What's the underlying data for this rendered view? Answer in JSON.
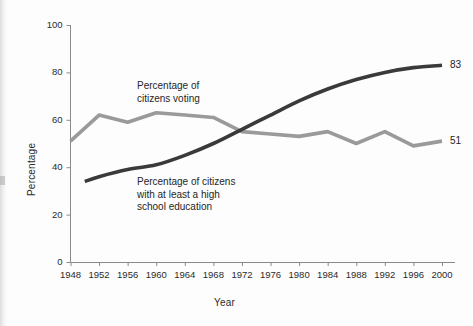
{
  "chart_data": {
    "type": "line",
    "title": "",
    "xlabel": "Year",
    "ylabel": "Percentage",
    "xlim": [
      1948,
      2000
    ],
    "ylim": [
      0,
      100
    ],
    "grid": false,
    "legend_position": "inline-annotations",
    "x": [
      1948,
      1952,
      1956,
      1960,
      1964,
      1968,
      1972,
      1976,
      1980,
      1984,
      1988,
      1992,
      1996,
      2000
    ],
    "xticklabels": [
      "1948",
      "1952",
      "1956",
      "1960",
      "1964",
      "1968",
      "1972",
      "1976",
      "1980",
      "1984",
      "1988",
      "1992",
      "1996",
      "2000"
    ],
    "yticks": [
      0,
      20,
      40,
      60,
      80,
      100
    ],
    "yticklabels": [
      "0",
      "20",
      "40",
      "60",
      "80",
      "100"
    ],
    "series": [
      {
        "name": "Percentage of citizens voting",
        "color": "#9a9a9a",
        "values": [
          51,
          62,
          59,
          63,
          62,
          61,
          55,
          54,
          53,
          55,
          50,
          55,
          49,
          51
        ],
        "end_label": "51"
      },
      {
        "name": "Percentage of citizens with at least a high school education",
        "color": "#3a3a3a",
        "values": [
          34,
          36,
          39,
          41,
          45,
          50,
          56,
          62,
          68,
          73,
          77,
          80,
          82,
          83
        ],
        "end_label": "83"
      }
    ],
    "annotations": [
      {
        "id": "voting-annotation",
        "text": "Percentage of\ncitizens voting",
        "x_px": 137,
        "y_px": 80
      },
      {
        "id": "education-annotation",
        "text": "Percentage of citizens\nwith at least a high\nschool education",
        "x_px": 137,
        "y_px": 176
      }
    ]
  }
}
